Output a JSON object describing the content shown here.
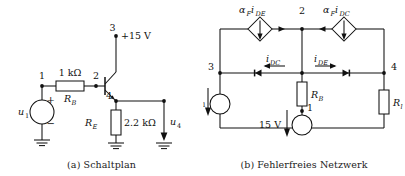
{
  "figure": {
    "panels": [
      {
        "id": "a",
        "caption": "(a) Schaltplan",
        "nodes": {
          "n1": "1",
          "n2": "2",
          "n3": "3",
          "n4": "4"
        },
        "components": {
          "source_label": "u",
          "source_sub": "1",
          "source_plus": "+",
          "source_minus": "−",
          "rb_value": "1 kΩ",
          "rb_name": "R",
          "rb_sub": "B",
          "re_name": "R",
          "re_sub": "E",
          "re_value": "2.2 kΩ",
          "supply": "+15 V",
          "out_label": "u",
          "out_sub": "4"
        }
      },
      {
        "id": "b",
        "caption": "(b) Fehlerfreies Netzwerk",
        "nodes": {
          "n1": "1",
          "n2": "2",
          "n3": "3",
          "n4": "4"
        },
        "components": {
          "cs_left_alpha": "α",
          "cs_left_alpha_sub": "F",
          "cs_left_cur": "i",
          "cs_left_cur_sub": "DE",
          "cs_right_alpha": "α",
          "cs_right_alpha_sub": "F",
          "cs_right_cur": "i",
          "cs_right_cur_sub": "DC",
          "diode_left_label": "i",
          "diode_left_sub": "DC",
          "diode_right_label": "i",
          "diode_right_sub": "DE",
          "rb_name": "R",
          "rb_sub": "B",
          "rl_name": "R",
          "rl_sub": "l",
          "src_left_label": "u",
          "src_left_sub": "1",
          "src_mid_label": "15 V"
        }
      }
    ]
  },
  "colors": {
    "ink": "#111111",
    "background": "#ffffff"
  }
}
